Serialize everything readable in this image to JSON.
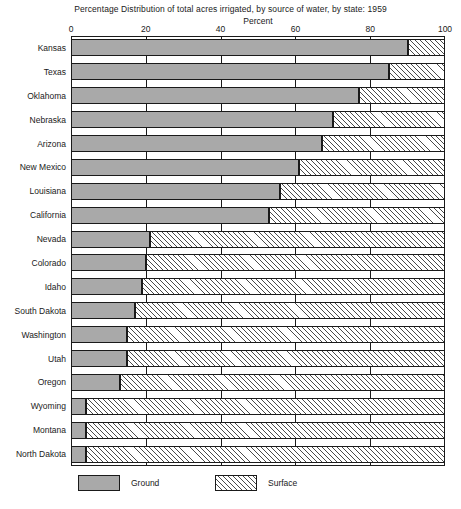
{
  "chart_data": {
    "type": "bar",
    "orientation": "horizontal",
    "stacked": true,
    "title": "Percentage Distribution of total acres irrigated, by source of water, by state: 1959",
    "xlabel": "Percent",
    "ylabel": "",
    "xlim": [
      0,
      100
    ],
    "xticks": [
      0,
      20,
      40,
      60,
      80,
      100
    ],
    "xtick_labels": [
      "0",
      "20",
      "40",
      "60",
      "80",
      "100"
    ],
    "grid": false,
    "legend_position": "bottom",
    "categories": [
      "Kansas",
      "Texas",
      "Oklahoma",
      "Nebraska",
      "Arizona",
      "New Mexico",
      "Louisiana",
      "California",
      "Nevada",
      "Colorado",
      "Idaho",
      "South Dakota",
      "Washington",
      "Utah",
      "Oregon",
      "Wyoming",
      "Montana",
      "North Dakota"
    ],
    "series": [
      {
        "name": "Ground",
        "color": "#a9a9a9",
        "pattern": "solid",
        "values": [
          90,
          85,
          77,
          70,
          67,
          61,
          56,
          53,
          21,
          20,
          19,
          17,
          15,
          15,
          13,
          4,
          4,
          4
        ]
      },
      {
        "name": "Surface",
        "color": "#ffffff",
        "pattern": "diagonal-hatch",
        "values": [
          10,
          15,
          23,
          30,
          33,
          39,
          44,
          47,
          79,
          80,
          81,
          83,
          85,
          85,
          87,
          96,
          96,
          96
        ]
      }
    ]
  },
  "legend": {
    "items": [
      {
        "label": "Ground",
        "swatch": "ground"
      },
      {
        "label": "Surface",
        "swatch": "surface"
      }
    ]
  }
}
